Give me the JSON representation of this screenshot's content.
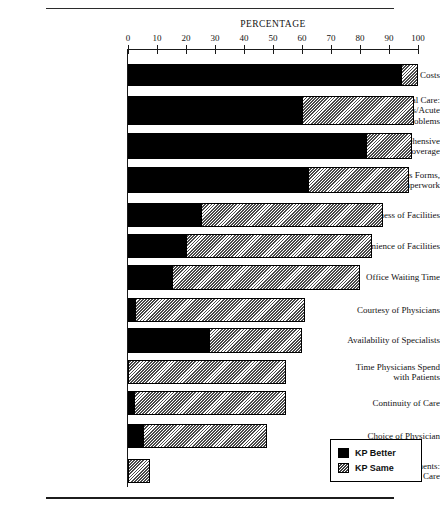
{
  "chart_data": {
    "type": "bar",
    "orientation": "horizontal",
    "stacked": true,
    "title": "PERCENTAGE",
    "xlabel": "PERCENTAGE",
    "ylabel": "",
    "xlim": [
      0,
      100
    ],
    "grid": false,
    "legend_position": "bottom-right",
    "tick_labels": [
      "0",
      "10",
      "20",
      "30",
      "40",
      "50",
      "60",
      "70",
      "80",
      "90",
      "100"
    ],
    "ticks": [
      0,
      10,
      20,
      30,
      40,
      50,
      60,
      70,
      80,
      90,
      100
    ],
    "categories": [
      "Costs",
      "Availability of Medical Care: Emergencies/Acute Problems",
      "Comprehensive Benefits/Coverage",
      "No Claims Forms, Paperwork",
      "Attractiveness of Facilities",
      "Convenience of Facilities",
      "Office Waiting Time",
      "Courtesy of Physicians",
      "Availability of Specialists",
      "Time Physicians Spend with Patients",
      "Continuity of Care",
      "Choice of Physician",
      "Appointments: Routine Care"
    ],
    "series": [
      {
        "name": "KP Better",
        "color": "#000000",
        "values": [
          94,
          60,
          82,
          62,
          25,
          20,
          15,
          2.5,
          28,
          0,
          2,
          5,
          0
        ]
      },
      {
        "name": "KP Same",
        "color": "#b4b4b4",
        "values": [
          6,
          38.5,
          16,
          35,
          63,
          64,
          65,
          58.5,
          32,
          54.5,
          52.5,
          43,
          7.5
        ]
      }
    ]
  },
  "rows": [
    {
      "label_lines": [
        "Costs"
      ],
      "better": 94,
      "same": 6
    },
    {
      "label_lines": [
        "Availability of Medical Care:",
        "Emergencies/Acute",
        "Problems"
      ],
      "better": 60,
      "same": 38.5
    },
    {
      "label_lines": [
        "Comprehensive",
        "Benefits/Coverage"
      ],
      "better": 82,
      "same": 16
    },
    {
      "label_lines": [
        "No Claims Forms,",
        "Paperwork"
      ],
      "better": 62,
      "same": 35
    },
    {
      "label_lines": [
        "Attractiveness of Facilities"
      ],
      "better": 25,
      "same": 63
    },
    {
      "label_lines": [
        "Convenience of Facilities"
      ],
      "better": 20,
      "same": 64
    },
    {
      "label_lines": [
        "Office Waiting Time"
      ],
      "better": 15,
      "same": 65
    },
    {
      "label_lines": [
        "Courtesy of Physicians"
      ],
      "better": 2.5,
      "same": 58.5
    },
    {
      "label_lines": [
        "Availability of Specialists"
      ],
      "better": 28,
      "same": 32
    },
    {
      "label_lines": [
        "Time Physicians Spend",
        "with Patients"
      ],
      "better": 0,
      "same": 54.5
    },
    {
      "label_lines": [
        "Continuity of Care"
      ],
      "better": 2,
      "same": 52.5
    },
    {
      "label_lines": [
        "Choice of Physician"
      ],
      "better": 5,
      "same": 43
    },
    {
      "label_lines": [
        "Appointments:",
        "Routine Care"
      ],
      "better": 0,
      "same": 7.5
    }
  ],
  "legend": {
    "items": [
      {
        "label": "KP Better",
        "pattern": "solid-black"
      },
      {
        "label": "KP Same",
        "pattern": "hatched-gray"
      }
    ]
  },
  "colors": {
    "better": "#000000",
    "same": "#b4b4b4",
    "axis": "#1a1a1a",
    "text": "#121212"
  }
}
